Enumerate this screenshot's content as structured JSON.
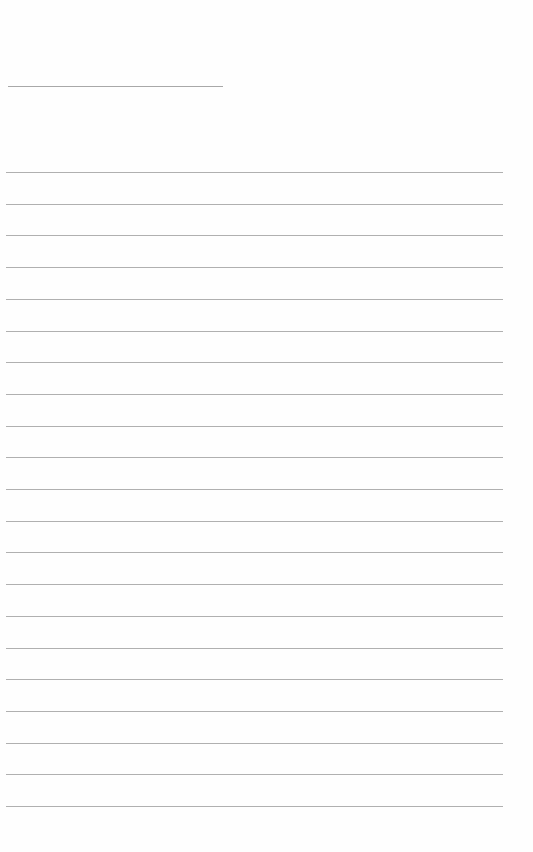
{
  "page": {
    "type": "lined-paper",
    "title_line": {
      "x": 8,
      "y": 86,
      "width": 215
    },
    "rule_color": "#b0b0b0",
    "rules": {
      "count": 21,
      "start_y": 172,
      "spacing": 31.7,
      "x": 6,
      "width": 497
    }
  }
}
